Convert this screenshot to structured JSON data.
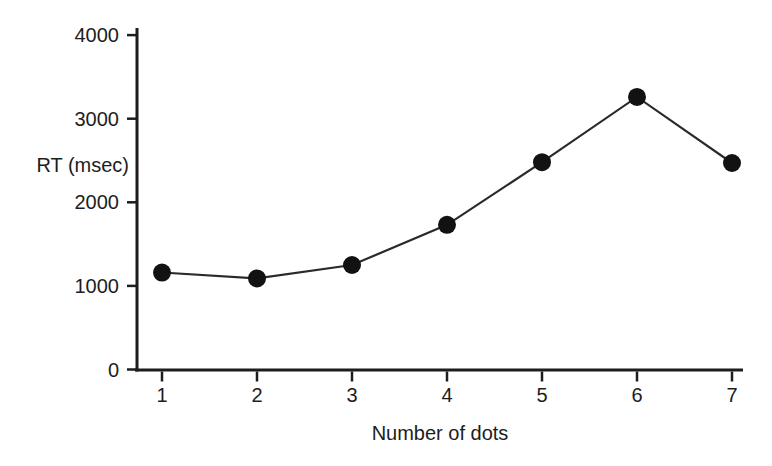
{
  "figure": {
    "background": "#ffffff",
    "ink_color": "#1d1d1d"
  },
  "chart_data": {
    "type": "line",
    "title": "",
    "xlabel": "Number of dots",
    "ylabel": "RT (msec)",
    "x": [
      1,
      2,
      3,
      4,
      5,
      6,
      7
    ],
    "series": [
      {
        "name": "RT",
        "values": [
          1160,
          1090,
          1250,
          1730,
          2480,
          3260,
          2470
        ]
      }
    ],
    "xticks": [
      1,
      2,
      3,
      4,
      5,
      6,
      7
    ],
    "yticks": [
      0,
      1000,
      2000,
      3000,
      4000
    ],
    "xlim": [
      0.73,
      7.12
    ],
    "ylim": [
      0,
      4000
    ],
    "grid": false,
    "legend": "none",
    "marker": "filled-circle",
    "line_color": "#2a2a2a",
    "marker_color": "#121212",
    "axis_color": "#1d1d1d"
  }
}
